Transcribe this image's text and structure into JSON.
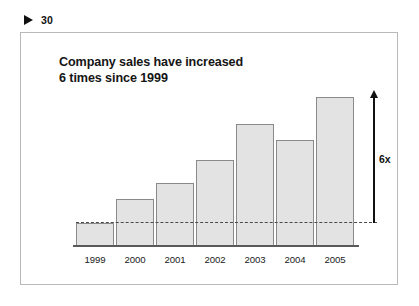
{
  "header": {
    "marker_icon": "triangle-right-icon",
    "page_number": "30"
  },
  "slide": {
    "title_line_1": "Company sales have increased",
    "title_line_2": "6 times since 1999"
  },
  "annotation": {
    "growth_label": "6x",
    "arrow_icon": "arrow-up-icon"
  },
  "colors": {
    "bar_fill": "#e3e3e3",
    "bar_stroke": "#8a8a8a",
    "axis": "#595959",
    "dashed_line": "#4a4a4a",
    "text": "#151515",
    "frame_border": "#b9b9b9"
  },
  "chart_data": {
    "type": "bar",
    "title": "Company sales have increased 6 times since 1999",
    "xlabel": "",
    "ylabel": "",
    "categories": [
      "1999",
      "2000",
      "2001",
      "2002",
      "2003",
      "2004",
      "2005"
    ],
    "values": [
      1.0,
      2.1,
      2.8,
      3.8,
      5.4,
      4.7,
      6.6
    ],
    "ylim": [
      0,
      7.0
    ],
    "grid": false,
    "legend": false,
    "value_unit": "multiples of 1999 sales",
    "reference_line": {
      "value": 1.0,
      "style": "dashed",
      "label": ""
    },
    "annotations": [
      {
        "text": "6x",
        "type": "arrow-up",
        "from_value": 1.0,
        "to_value": 6.6,
        "at_category": "2005"
      }
    ]
  }
}
